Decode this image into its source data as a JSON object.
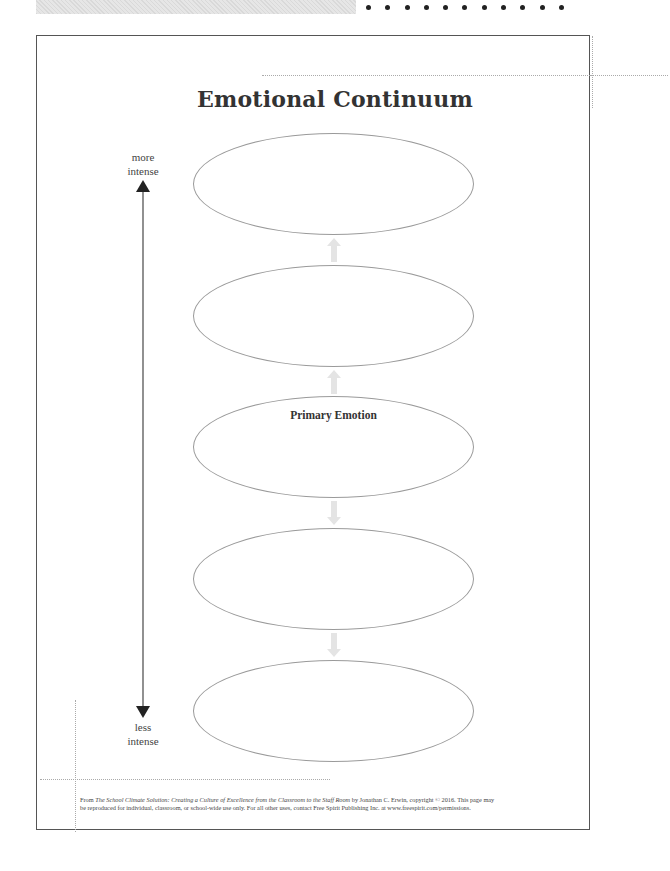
{
  "title": "Emotional Continuum",
  "axis": {
    "top_label_line1": "more",
    "top_label_line2": "intense",
    "bottom_label_line1": "less",
    "bottom_label_line2": "intense"
  },
  "ellipses": [
    {
      "label": ""
    },
    {
      "label": ""
    },
    {
      "label": "Primary Emotion"
    },
    {
      "label": ""
    },
    {
      "label": ""
    }
  ],
  "connectors": [
    {
      "direction": "up",
      "icon": "up-arrow-icon"
    },
    {
      "direction": "up",
      "icon": "up-arrow-icon"
    },
    {
      "direction": "down",
      "icon": "down-arrow-icon"
    },
    {
      "direction": "down",
      "icon": "down-arrow-icon"
    }
  ],
  "footer": {
    "prefix": "From ",
    "book_title": "The School Climate Solution: Creating a Culture of Excellence from the Classroom to the Staff Room",
    "line1_rest": " by Jonathan C. Erwin, copyright © 2016. This page may",
    "line2": "be reproduced for individual, classroom, or school-wide use only. For all other uses, contact Free Spirit Publishing Inc. at www.freespirit.com/permissions."
  },
  "colors": {
    "border": "#555555",
    "ellipse_stroke": "#9a9a9a",
    "connector_fill": "#e4e4e4",
    "text": "#333333",
    "dotted_guides": "#aaaaaa"
  }
}
